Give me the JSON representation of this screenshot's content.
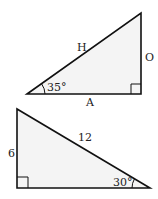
{
  "triangles": [
    {
      "id": "triangle-1",
      "angle_label": "35°",
      "hypotenuse_label": "H",
      "opposite_label": "O",
      "adjacent_label": "A",
      "right_angle_marker": true
    },
    {
      "id": "triangle-2",
      "angle_label": "30°",
      "hypotenuse_label": "12",
      "vertical_side_label": "6",
      "right_angle_marker": true
    }
  ],
  "colors": {
    "fill": "#f4f4f4",
    "stroke": "#111111"
  }
}
